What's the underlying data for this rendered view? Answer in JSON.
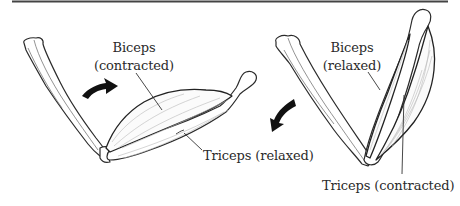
{
  "figure": {
    "top_rule": true,
    "panels": [
      {
        "id": "flexion",
        "arrow_direction": "clockwise-up",
        "labels": {
          "biceps_line1": "Biceps",
          "biceps_line2": "(contracted)",
          "triceps": "Triceps (relaxed)"
        }
      },
      {
        "id": "extension",
        "arrow_direction": "down-left",
        "labels": {
          "biceps_line1": "Biceps",
          "biceps_line2": "(relaxed)",
          "triceps": "Triceps (contracted)"
        }
      }
    ]
  },
  "colors": {
    "ink": "#222222",
    "background": "#ffffff",
    "fiber": "#b8b8b8"
  }
}
